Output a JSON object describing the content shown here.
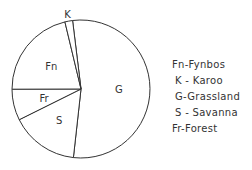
{
  "chart_data": {
    "type": "pie",
    "title": "",
    "start": "top",
    "direction": "clockwise",
    "slices": [
      {
        "label": "G",
        "name": "Grassland",
        "percent": 53.7
      },
      {
        "label": "S",
        "name": "Savanna",
        "percent": 15.9
      },
      {
        "label": "Fr",
        "name": "Forest",
        "percent": 7.3
      },
      {
        "label": "Fn",
        "name": "Fynbos",
        "percent": 21.3
      },
      {
        "label": "K",
        "name": "Karoo",
        "percent": 1.8
      }
    ],
    "legend": {
      "placement": "right",
      "entries": [
        "Fn-Fynbos",
        "K - Karoo",
        "G-Grassland",
        "S - Savanna",
        "Fr-Forest"
      ]
    }
  },
  "colors": {
    "stroke": "#333333",
    "fill": "#ffffff",
    "text": "#333333"
  }
}
